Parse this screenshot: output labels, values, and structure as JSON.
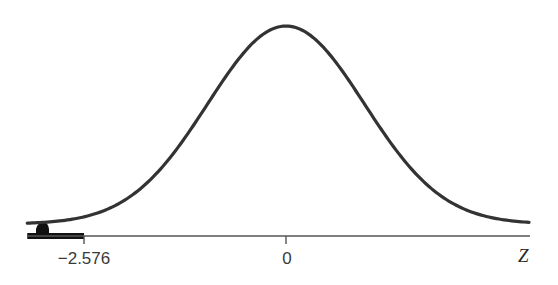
{
  "chart_data": {
    "type": "area",
    "title": "",
    "subtitle": "",
    "xlabel": "Z",
    "ylabel": "",
    "distribution": "standard normal",
    "mean": 0,
    "sd": 1,
    "xlim": [
      -3.3,
      3.1
    ],
    "tick_values": [
      -2.576,
      0
    ],
    "tick_labels": [
      "−2.576",
      "0"
    ],
    "shaded_region": {
      "from": -3.3,
      "to": -2.576,
      "side": "left tail"
    },
    "grid": false,
    "legend": null,
    "colors": {
      "curve": "#333333",
      "axis": "#444444",
      "shade": "#111111"
    }
  },
  "labels": {
    "tick_neg": "−2.576",
    "tick_zero": "0",
    "axis_var": "Z"
  }
}
